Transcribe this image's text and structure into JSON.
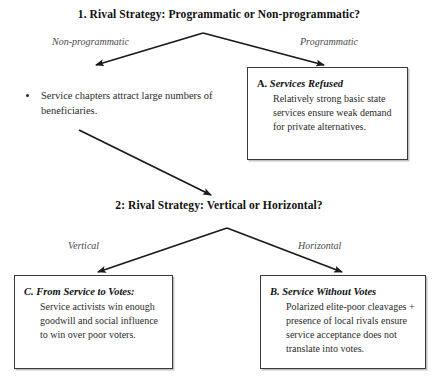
{
  "diagram": {
    "title_q1": "1. Rival Strategy: Programmatic or Non-programmatic?",
    "title_q2": "2: Rival Strategy: Vertical or Horizontal?",
    "labels": {
      "non_programmatic": "Non-programmatic",
      "programmatic": "Programmatic",
      "vertical": "Vertical",
      "horizontal": "Horizontal"
    },
    "bullet": {
      "text": "Service chapters attract large numbers of beneficiaries."
    },
    "boxes": {
      "a": {
        "lead": "A.",
        "name": "Services Refused",
        "body": "Relatively strong basic state services ensure weak demand for private alternatives."
      },
      "c": {
        "lead": "C.",
        "name": "From Service to Votes:",
        "body": "Service activists win enough goodwill and social influence to win over poor voters."
      },
      "b": {
        "lead": "B.",
        "name": "Service Without Votes",
        "body": "Polarized elite-poor cleavages + presence of local rivals ensure service acceptance does not translate into votes."
      }
    },
    "colors": {
      "arrow": "#1a1a1a",
      "box_border": "#3a3a3a",
      "text": "#1a1a1a",
      "label_text": "#4a4a4a",
      "background": "#ffffff"
    }
  }
}
